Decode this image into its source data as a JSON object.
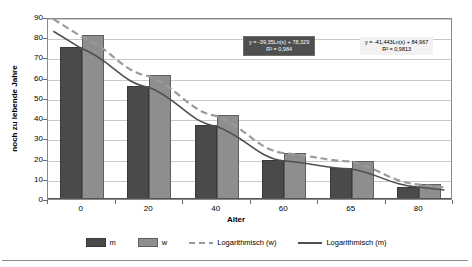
{
  "chart_data": {
    "type": "bar",
    "title": "",
    "xlabel": "Alter",
    "ylabel": "noch zu lebende Jahre",
    "categories": [
      "0",
      "20",
      "40",
      "60",
      "65",
      "80"
    ],
    "ylim": [
      0,
      90
    ],
    "yticks": [
      0,
      10,
      20,
      30,
      40,
      50,
      60,
      70,
      80,
      90
    ],
    "grid": true,
    "legend_position": "bottom",
    "series": [
      {
        "name": "m",
        "values": [
          75.2,
          55.9,
          36.4,
          19.1,
          15.1,
          6.0
        ],
        "color": "#4a4a4a"
      },
      {
        "name": "w",
        "values": [
          81.1,
          61.4,
          41.6,
          23.0,
          18.8,
          7.3
        ],
        "color": "#8e8e8e"
      }
    ],
    "trendlines": [
      {
        "name": "Logarithmisch (w)",
        "style": "dashed",
        "color": "#9a9a9a",
        "equation": "y = -41,443Ln(x) + 84,967",
        "r_squared": "R² = 0,9813"
      },
      {
        "name": "Logarithmisch (m)",
        "style": "solid",
        "color": "#4f4f4f",
        "equation": "y = -39,35Ln(x) + 78,329",
        "r_squared": "R² = 0,984"
      }
    ],
    "annotations": [
      {
        "id": "annotation-m",
        "line1": "y = -39,35Ln(x) + 78,329",
        "line2": "R² = 0,984",
        "background": "#4f4f4f",
        "text_color": "#ffffff"
      },
      {
        "id": "annotation-w",
        "line1": "y = -41,443Ln(x) + 84,967",
        "line2": "R² = 0,9813",
        "background": "#f2f2f2",
        "text_color": "#000000"
      }
    ]
  },
  "legend": {
    "items": [
      {
        "label": "m",
        "kind": "bar",
        "color": "#4a4a4a"
      },
      {
        "label": "w",
        "kind": "bar",
        "color": "#8e8e8e"
      },
      {
        "label": "Logarithmisch (w)",
        "kind": "dashed-line",
        "color": "#9a9a9a"
      },
      {
        "label": "Logarithmisch (m)",
        "kind": "solid-line",
        "color": "#4f4f4f"
      }
    ]
  }
}
